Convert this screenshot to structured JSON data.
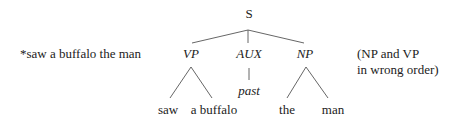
{
  "example": {
    "sentence": "*saw a buffalo the man",
    "note_line1": "(NP and VP",
    "note_line2": "in wrong order)"
  },
  "tree": {
    "root": "S",
    "children": [
      {
        "label": "VP",
        "leaves": [
          "saw",
          "a buffalo"
        ]
      },
      {
        "label": "AUX",
        "leaves": [
          "past"
        ]
      },
      {
        "label": "NP",
        "leaves": [
          "the",
          "man"
        ]
      }
    ]
  },
  "colors": {
    "text": "#222222",
    "edge": "#555555",
    "background": "#ffffff"
  }
}
